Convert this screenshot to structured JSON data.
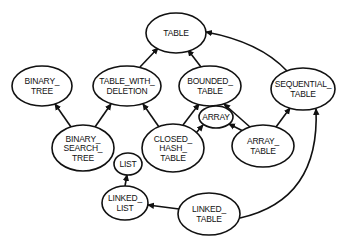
{
  "diagram": {
    "type": "class-inheritance-graph",
    "nodes": [
      {
        "id": "table",
        "lines": [
          "TABLE"
        ],
        "cx": 176,
        "cy": 33,
        "rx": 30,
        "ry": 20
      },
      {
        "id": "binary_tree",
        "lines": [
          "BINARY_",
          "TREE"
        ],
        "cx": 42,
        "cy": 86,
        "rx": 30,
        "ry": 20
      },
      {
        "id": "table_with_deletion",
        "lines": [
          "TABLE_WITH_",
          "DELETION"
        ],
        "cx": 127,
        "cy": 86,
        "rx": 34,
        "ry": 20
      },
      {
        "id": "bounded_table",
        "lines": [
          "BOUNDED_",
          "TABLE"
        ],
        "cx": 210,
        "cy": 86,
        "rx": 31,
        "ry": 20
      },
      {
        "id": "sequential_table",
        "lines": [
          "SEQUENTIAL_",
          "TABLE"
        ],
        "cx": 303,
        "cy": 89,
        "rx": 32,
        "ry": 21
      },
      {
        "id": "binary_search_tree",
        "lines": [
          "BINARY_",
          "SEARCH_",
          "TREE"
        ],
        "cx": 83,
        "cy": 148,
        "rx": 31,
        "ry": 23
      },
      {
        "id": "array",
        "lines": [
          "ARRAY"
        ],
        "cx": 216,
        "cy": 117,
        "rx": 17,
        "ry": 11
      },
      {
        "id": "closed_hash_table",
        "lines": [
          "CLOSED_",
          "HASH_",
          "TABLE"
        ],
        "cx": 173,
        "cy": 148,
        "rx": 31,
        "ry": 24
      },
      {
        "id": "array_table",
        "lines": [
          "ARRAY_",
          "TABLE"
        ],
        "cx": 263,
        "cy": 146,
        "rx": 31,
        "ry": 21
      },
      {
        "id": "list",
        "lines": [
          "LIST"
        ],
        "cx": 128,
        "cy": 164,
        "rx": 14,
        "ry": 11
      },
      {
        "id": "linked_list",
        "lines": [
          "LINKED_",
          "LIST"
        ],
        "cx": 125,
        "cy": 203,
        "rx": 23,
        "ry": 17
      },
      {
        "id": "linked_table",
        "lines": [
          "LINKED_",
          "TABLE"
        ],
        "cx": 209,
        "cy": 214,
        "rx": 31,
        "ry": 21
      }
    ],
    "edges": [
      {
        "from": "table_with_deletion",
        "to": "table",
        "path": "M 140 67 L 158 48"
      },
      {
        "from": "bounded_table",
        "to": "table",
        "path": "M 201 67 L 188 50"
      },
      {
        "from": "sequential_table",
        "to": "table",
        "path": "M 287 71 Q 260 42 206 32"
      },
      {
        "from": "binary_search_tree",
        "to": "binary_tree",
        "path": "M 71 127 L 55 104"
      },
      {
        "from": "binary_search_tree",
        "to": "table_with_deletion",
        "path": "M 95 127 L 111 104"
      },
      {
        "from": "closed_hash_table",
        "to": "table_with_deletion",
        "path": "M 159 127 L 143 104"
      },
      {
        "from": "closed_hash_table",
        "to": "bounded_table",
        "path": "M 183 125 L 199 104"
      },
      {
        "from": "closed_hash_table",
        "to": "array",
        "path": "M 196 133 L 203 125"
      },
      {
        "from": "array_table",
        "to": "array",
        "path": "M 243 131 L 229 124"
      },
      {
        "from": "array_table",
        "to": "bounded_table",
        "path": "M 250 127 L 224 104"
      },
      {
        "from": "array_table",
        "to": "sequential_table",
        "path": "M 276 127 L 290 108"
      },
      {
        "from": "linked_list",
        "to": "list",
        "path": "M 125 186 L 127 175"
      },
      {
        "from": "linked_table",
        "to": "linked_list",
        "path": "M 179 209 L 148 205"
      },
      {
        "from": "linked_table",
        "to": "sequential_table",
        "path": "M 240 218 Q 320 200 316 109"
      }
    ]
  }
}
